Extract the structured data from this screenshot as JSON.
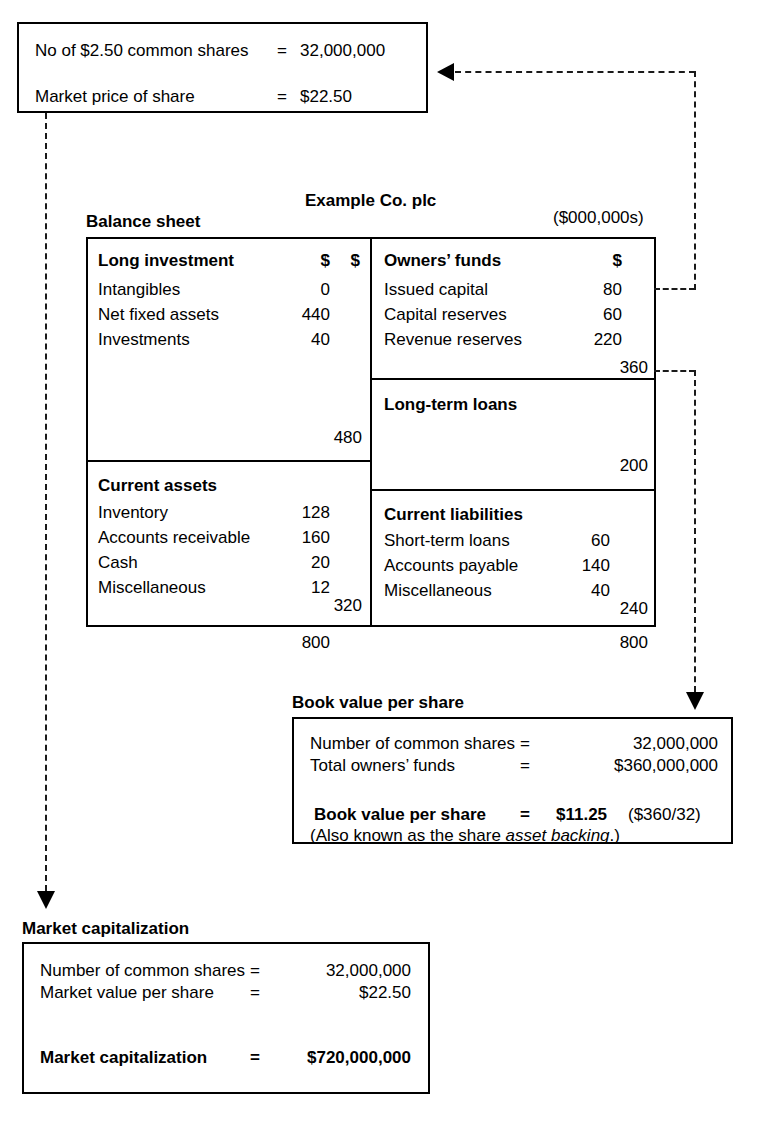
{
  "share_info_box": {
    "rows": [
      {
        "label": "No of $2.50 common shares",
        "eq": "=",
        "value": "32,000,000"
      },
      {
        "label": "Market price of share",
        "eq": "=",
        "value": "$22.50"
      }
    ]
  },
  "balance_sheet": {
    "company_title": "Example Co. plc",
    "section_title": "Balance sheet",
    "units": "($000,000s)",
    "assets": {
      "long_investment": {
        "heading": "Long investment",
        "col_head_1": "$",
        "col_head_2": "$",
        "rows": [
          {
            "label": "Intangibles",
            "value": "0"
          },
          {
            "label": "Net fixed assets",
            "value": "440"
          },
          {
            "label": "Investments",
            "value": "40"
          }
        ],
        "subtotal": "480"
      },
      "current_assets": {
        "heading": "Current assets",
        "rows": [
          {
            "label": "Inventory",
            "value": "128"
          },
          {
            "label": "Accounts receivable",
            "value": "160"
          },
          {
            "label": "Cash",
            "value": "20"
          },
          {
            "label": "Miscellaneous",
            "value": "12"
          }
        ],
        "subtotal": "320"
      },
      "total": "800"
    },
    "liabilities": {
      "owners_funds": {
        "heading": "Owners’ funds",
        "col_head": "$",
        "rows": [
          {
            "label": "Issued capital",
            "value": "80"
          },
          {
            "label": "Capital reserves",
            "value": "60"
          },
          {
            "label": "Revenue reserves",
            "value": "220"
          }
        ],
        "subtotal": "360"
      },
      "long_term_loans": {
        "heading": "Long-term loans",
        "subtotal": "200"
      },
      "current_liabilities": {
        "heading": "Current liabilities",
        "rows": [
          {
            "label": "Short-term loans",
            "value": "60"
          },
          {
            "label": "Accounts payable",
            "value": "140"
          },
          {
            "label": "Miscellaneous",
            "value": "40"
          }
        ],
        "subtotal": "240"
      },
      "total": "800"
    }
  },
  "book_value": {
    "title": "Book value per share",
    "rows": [
      {
        "label": "Number of common shares",
        "eq": "=",
        "value": "32,000,000"
      },
      {
        "label": "Total owners’ funds",
        "eq": "=",
        "value": "$360,000,000"
      }
    ],
    "result": {
      "label": "Book value per share",
      "eq": "=",
      "value": "$11.25",
      "note": "($360/32)"
    },
    "footnote_pre": "(Also known as the share ",
    "footnote_em": "asset backing",
    "footnote_post": ".)"
  },
  "market_capitalization": {
    "title": "Market capitalization",
    "rows": [
      {
        "label": "Number of common shares",
        "eq": "=",
        "value": "32,000,000"
      },
      {
        "label": "Market value per share",
        "eq": "=",
        "value": "$22.50"
      }
    ],
    "result": {
      "label": "Market capitalization",
      "eq": "=",
      "value": "$720,000,000"
    }
  },
  "connectors": [
    {
      "name": "owners-funds-to-share-info",
      "from": "owners-funds-row",
      "to": "share-info-box"
    },
    {
      "name": "owners-funds-total-to-book-value",
      "from": "owners-funds-subtotal",
      "to": "book-value-box"
    },
    {
      "name": "share-info-to-market-cap",
      "from": "share-info-box",
      "to": "market-capitalization-box"
    }
  ],
  "colors": {
    "shade": "#8f8f8f",
    "line": "#000000",
    "background": "#ffffff"
  }
}
